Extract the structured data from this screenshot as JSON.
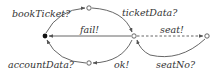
{
  "diagram": {
    "type": "state-machine",
    "nodes": [
      {
        "id": "start",
        "style": "filled",
        "x": 45,
        "y": 36
      },
      {
        "id": "top",
        "style": "open",
        "x": 89,
        "y": 8
      },
      {
        "id": "bottom",
        "style": "open",
        "x": 89,
        "y": 63
      },
      {
        "id": "center",
        "style": "open",
        "x": 134,
        "y": 36
      },
      {
        "id": "right",
        "style": "open",
        "x": 207,
        "y": 36
      }
    ],
    "edges": [
      {
        "from": "start",
        "to": "top",
        "label": "bookTicket?",
        "style": "solid"
      },
      {
        "from": "top",
        "to": "center",
        "label": "ticketData?",
        "style": "solid"
      },
      {
        "from": "center",
        "to": "start",
        "label": "fail!",
        "style": "solid"
      },
      {
        "from": "center",
        "to": "right",
        "label": "seat!",
        "style": "dashed"
      },
      {
        "from": "right",
        "to": "center",
        "label": "seatNo?",
        "style": "solid"
      },
      {
        "from": "center",
        "to": "bottom",
        "label": "ok!",
        "style": "solid"
      },
      {
        "from": "bottom",
        "to": "start",
        "label": "accountData?",
        "style": "solid"
      }
    ],
    "labels": {
      "bookTicket": "bookTicket?",
      "ticketData": "ticketData?",
      "fail": "fail!",
      "seat": "seat!",
      "seatNo": "seatNo?",
      "ok": "ok!",
      "accountData": "accountData?"
    },
    "colors": {
      "stroke": "#555555",
      "text": "#333333",
      "start_node": "#111111"
    }
  }
}
